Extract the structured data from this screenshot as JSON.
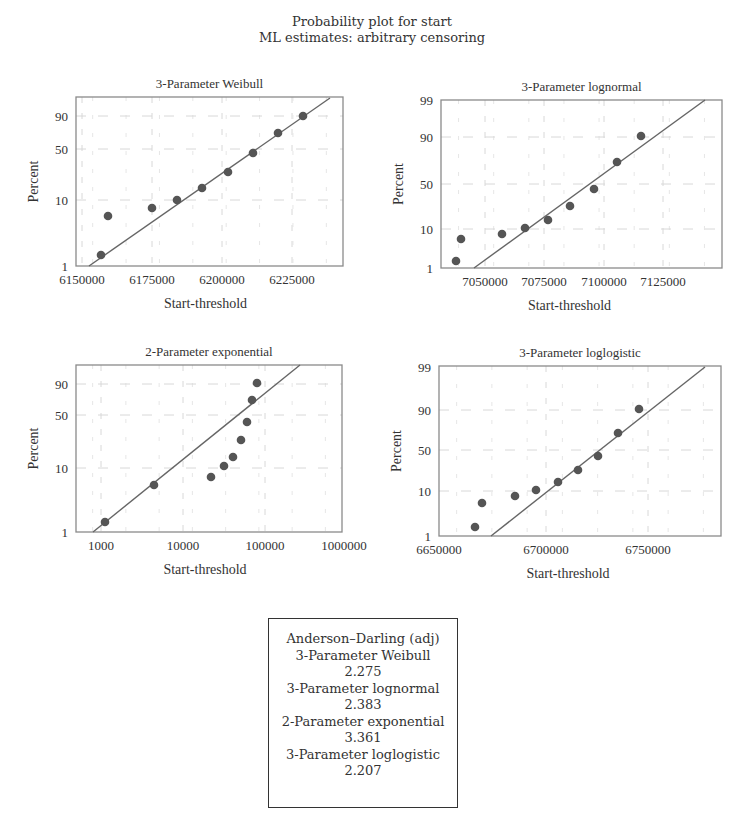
{
  "figure": {
    "title": "Probability plot for start",
    "subtitle": "ML estimates: arbitrary censoring"
  },
  "anderson_darling": {
    "header": "Anderson–Darling (adj)",
    "rows": [
      {
        "name": "3-Parameter Weibull",
        "value": "2.275"
      },
      {
        "name": "3-Parameter lognormal",
        "value": "2.383"
      },
      {
        "name": "2-Parameter exponential",
        "value": "3.361"
      },
      {
        "name": "3-Parameter loglogistic",
        "value": "2.207"
      }
    ]
  },
  "chart_data": [
    {
      "type": "scatter",
      "title": "3-Parameter Weibull",
      "xlabel": "Start-threshold",
      "ylabel": "Percent",
      "x_ticks": [
        "6150000",
        "6175000",
        "6200000",
        "6225000"
      ],
      "y_ticks": [
        "1",
        "10",
        "50",
        "90"
      ],
      "y_scale": "weibull probability",
      "grid": true,
      "points": {
        "x": [
          6157000,
          6159500,
          6175000,
          6184000,
          6193000,
          6202000,
          6211000,
          6220000,
          6229000
        ],
        "y": [
          1.4,
          6,
          7.5,
          10.5,
          16,
          24,
          42,
          68,
          90
        ]
      },
      "fit_line": {
        "x": [
          6152500,
          6238500
        ],
        "y": [
          1,
          99
        ]
      },
      "_px": {
        "box": [
          76,
          97,
          343,
          266
        ],
        "xticks_px": [
          82,
          152,
          222,
          292
        ],
        "yticks_px": [
          266,
          200,
          149,
          116
        ],
        "pts": [
          [
            101,
            255
          ],
          [
            108,
            216
          ],
          [
            152,
            208
          ],
          [
            177,
            200
          ],
          [
            202,
            188
          ],
          [
            228,
            172
          ],
          [
            253,
            153
          ],
          [
            278,
            133
          ],
          [
            303,
            116
          ]
        ],
        "line": [
          [
            89,
            266
          ],
          [
            330,
            98
          ]
        ]
      }
    },
    {
      "type": "scatter",
      "title": "3-Parameter lognormal",
      "xlabel": "Start-threshold",
      "ylabel": "Percent",
      "x_ticks": [
        "7050000",
        "7075000",
        "7100000",
        "7125000"
      ],
      "y_ticks": [
        "1",
        "10",
        "50",
        "90",
        "99"
      ],
      "y_scale": "normal probability",
      "grid": true,
      "points": {
        "x": [
          7038500,
          7040500,
          7057500,
          7067000,
          7076500,
          7086000,
          7095500,
          7105500,
          7115500
        ],
        "y": [
          1.5,
          5.5,
          7,
          10,
          14,
          23,
          42,
          73,
          93
        ]
      },
      "fit_line": {
        "x": [
          7046000,
          7141000
        ],
        "y": [
          1,
          99
        ]
      },
      "_px": {
        "box": [
          441,
          100,
          722,
          268
        ],
        "xticks_px": [
          485,
          544,
          604,
          663
        ],
        "yticks_px": [
          268,
          229,
          184,
          137,
          100
        ],
        "pts": [
          [
            456,
            261
          ],
          [
            461,
            239
          ],
          [
            502,
            234
          ],
          [
            525,
            228
          ],
          [
            548,
            220
          ],
          [
            570,
            206
          ],
          [
            594,
            189
          ],
          [
            617,
            162
          ],
          [
            641,
            136
          ]
        ],
        "line": [
          [
            474,
            268
          ],
          [
            705,
            100
          ]
        ]
      }
    },
    {
      "type": "scatter",
      "title": "2-Parameter exponential",
      "xlabel": "Start-threshold",
      "ylabel": "Percent",
      "x_ticks": [
        "1000",
        "10000",
        "100000",
        "1000000"
      ],
      "x_scale": "log",
      "y_ticks": [
        "1",
        "10",
        "50",
        "90"
      ],
      "y_scale": "exponential probability",
      "grid": true,
      "points": {
        "x": [
          1100,
          4500,
          23000,
          33000,
          43000,
          55000,
          65000,
          75000,
          85000
        ],
        "y": [
          1.4,
          5.5,
          6.8,
          11,
          15,
          26,
          42,
          68,
          90
        ]
      },
      "fit_line": {
        "x": [
          750,
          290000
        ],
        "y": [
          1,
          99
        ]
      },
      "_px": {
        "box": [
          76,
          365,
          342,
          532
        ],
        "xticks_px": [
          101,
          183,
          265,
          344
        ],
        "yticks_px": [
          532,
          468,
          415,
          384
        ],
        "pts": [
          [
            105,
            522
          ],
          [
            154,
            485
          ],
          [
            211,
            477
          ],
          [
            224,
            466
          ],
          [
            233,
            457
          ],
          [
            241,
            440
          ],
          [
            247,
            422
          ],
          [
            252,
            400
          ],
          [
            257,
            383
          ]
        ],
        "line": [
          [
            93,
            532
          ],
          [
            300,
            365
          ]
        ]
      }
    },
    {
      "type": "scatter",
      "title": "3-Parameter loglogistic",
      "xlabel": "Start-threshold",
      "ylabel": "Percent",
      "x_ticks": [
        "6650000",
        "6700000",
        "6750000"
      ],
      "y_ticks": [
        "1",
        "10",
        "50",
        "90",
        "99"
      ],
      "y_scale": "logistic probability",
      "grid": true,
      "points": {
        "x": [
          6667000,
          6670500,
          6686500,
          6696500,
          6707000,
          6717000,
          6726500,
          6736500,
          6746500
        ],
        "y": [
          1.6,
          5.5,
          8,
          11,
          15,
          23,
          42,
          70,
          93
        ]
      },
      "fit_line": {
        "x": [
          6675000,
          6780000
        ],
        "y": [
          1,
          99
        ]
      },
      "_px": {
        "box": [
          439,
          366,
          721,
          536
        ],
        "xticks_px": [
          439,
          546,
          648
        ],
        "yticks_px": [
          536,
          491,
          450,
          410,
          367
        ],
        "pts": [
          [
            475,
            527
          ],
          [
            482,
            503
          ],
          [
            515,
            496
          ],
          [
            536,
            490
          ],
          [
            558,
            482
          ],
          [
            578,
            470
          ],
          [
            598,
            456
          ],
          [
            618,
            433
          ],
          [
            639,
            409
          ]
        ],
        "line": [
          [
            491,
            536
          ],
          [
            705,
            367
          ]
        ]
      }
    }
  ]
}
